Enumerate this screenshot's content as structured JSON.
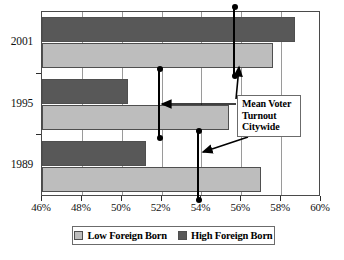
{
  "chart_data": {
    "type": "bar",
    "orientation": "horizontal",
    "title": "",
    "xlabel": "",
    "ylabel": "",
    "categories": [
      "2001",
      "1995",
      "1989"
    ],
    "series": [
      {
        "name": "High Foreign Born",
        "color": "#585858",
        "values": [
          58.7,
          50.3,
          51.2
        ]
      },
      {
        "name": "Low Foreign Born",
        "color": "#bdbdbd",
        "values": [
          57.6,
          55.4,
          57.0
        ]
      }
    ],
    "markers": {
      "name": "Mean Voter Turnout Citywide",
      "values": [
        55.7,
        51.9,
        53.9
      ]
    },
    "xlim": [
      46,
      60
    ],
    "xticks": [
      46,
      48,
      50,
      52,
      54,
      56,
      58,
      60
    ],
    "xtick_labels": [
      "46%",
      "48%",
      "50%",
      "52%",
      "54%",
      "56%",
      "58%",
      "60%"
    ],
    "grid": true,
    "grid_axis": "x",
    "legend_position": "bottom"
  },
  "annotation": {
    "line1": "Mean Voter",
    "line2": "Turnout",
    "line3": "Citywide"
  },
  "legend": {
    "entries": [
      {
        "label": "Low Foreign Born"
      },
      {
        "label": "High Foreign Born"
      }
    ]
  }
}
